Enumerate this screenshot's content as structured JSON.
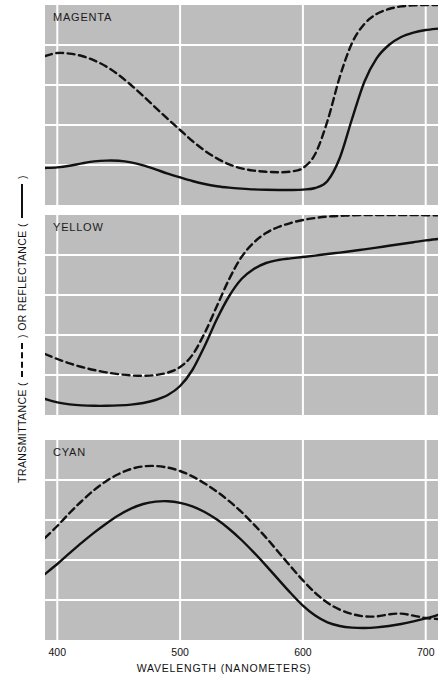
{
  "chart_data": {
    "type": "line",
    "title": "",
    "xlabel": "WAVELENGTH (NANOMETERS)",
    "ylabel": "TRANSMITTANCE (-----) OR REFLECTANCE (——)",
    "ylabel_parts": {
      "prefix": "TRANSMITTANCE (",
      "middle": ") OR REFLECTANCE (",
      "suffix": ")"
    },
    "xlim": [
      390,
      710
    ],
    "ylim": [
      0,
      1.0
    ],
    "xticks": [
      400,
      500,
      600,
      700
    ],
    "xtick_labels": [
      "400",
      "500",
      "600",
      "700"
    ],
    "yticks": [
      0,
      0.2,
      0.4,
      0.6,
      0.8,
      1.0
    ],
    "ytick_labels": [
      "0",
      ".2",
      ".4",
      ".6",
      ".8",
      "1.0"
    ],
    "grid": true,
    "grid_color": "#ffffff",
    "plot_background": "#bdbdbd",
    "legend": [
      {
        "name": "Transmittance",
        "style": "dashed",
        "color": "#111111"
      },
      {
        "name": "Reflectance",
        "style": "solid",
        "color": "#111111"
      }
    ],
    "x": [
      390,
      400,
      410,
      420,
      430,
      440,
      450,
      460,
      470,
      480,
      490,
      500,
      510,
      520,
      530,
      540,
      550,
      560,
      570,
      580,
      590,
      600,
      610,
      620,
      630,
      640,
      650,
      660,
      670,
      680,
      690,
      700,
      710
    ],
    "panels": [
      {
        "label": "MAGENTA",
        "series": [
          {
            "name": "Transmittance",
            "style": "dashed",
            "values": [
              0.745,
              0.76,
              0.757,
              0.745,
              0.723,
              0.692,
              0.65,
              0.6,
              0.545,
              0.487,
              0.43,
              0.375,
              0.32,
              0.272,
              0.233,
              0.203,
              0.183,
              0.172,
              0.166,
              0.164,
              0.167,
              0.185,
              0.255,
              0.42,
              0.64,
              0.81,
              0.905,
              0.955,
              0.98,
              0.993,
              0.998,
              1.0,
              1.0
            ]
          },
          {
            "name": "Reflectance",
            "style": "solid",
            "values": [
              0.185,
              0.188,
              0.196,
              0.208,
              0.218,
              0.222,
              0.221,
              0.213,
              0.198,
              0.178,
              0.157,
              0.138,
              0.12,
              0.105,
              0.094,
              0.087,
              0.082,
              0.078,
              0.076,
              0.075,
              0.075,
              0.077,
              0.085,
              0.12,
              0.235,
              0.43,
              0.615,
              0.733,
              0.8,
              0.84,
              0.862,
              0.875,
              0.882
            ]
          }
        ]
      },
      {
        "label": "YELLOW",
        "series": [
          {
            "name": "Transmittance",
            "style": "dashed",
            "values": [
              0.305,
              0.28,
              0.258,
              0.24,
              0.225,
              0.213,
              0.204,
              0.198,
              0.196,
              0.2,
              0.212,
              0.24,
              0.3,
              0.41,
              0.545,
              0.68,
              0.79,
              0.862,
              0.91,
              0.94,
              0.96,
              0.975,
              0.985,
              0.992,
              0.996,
              0.998,
              1.0,
              1.0,
              1.0,
              1.0,
              1.0,
              0.999,
              0.998
            ]
          },
          {
            "name": "Reflectance",
            "style": "solid",
            "values": [
              0.08,
              0.063,
              0.053,
              0.048,
              0.046,
              0.046,
              0.048,
              0.052,
              0.06,
              0.075,
              0.1,
              0.145,
              0.225,
              0.345,
              0.48,
              0.595,
              0.68,
              0.73,
              0.76,
              0.775,
              0.783,
              0.79,
              0.797,
              0.805,
              0.812,
              0.82,
              0.828,
              0.837,
              0.846,
              0.855,
              0.864,
              0.873,
              0.88
            ]
          }
        ]
      },
      {
        "label": "CYAN",
        "series": [
          {
            "name": "Transmittance",
            "style": "dashed",
            "values": [
              0.51,
              0.57,
              0.635,
              0.695,
              0.75,
              0.795,
              0.83,
              0.855,
              0.868,
              0.87,
              0.862,
              0.845,
              0.818,
              0.783,
              0.742,
              0.694,
              0.64,
              0.578,
              0.512,
              0.44,
              0.368,
              0.298,
              0.236,
              0.186,
              0.152,
              0.13,
              0.118,
              0.118,
              0.128,
              0.132,
              0.122,
              0.11,
              0.105
            ]
          },
          {
            "name": "Reflectance",
            "style": "solid",
            "values": [
              0.33,
              0.38,
              0.434,
              0.487,
              0.537,
              0.583,
              0.624,
              0.657,
              0.68,
              0.692,
              0.694,
              0.686,
              0.668,
              0.64,
              0.602,
              0.555,
              0.5,
              0.438,
              0.372,
              0.303,
              0.235,
              0.172,
              0.122,
              0.088,
              0.07,
              0.062,
              0.06,
              0.063,
              0.07,
              0.08,
              0.093,
              0.108,
              0.125
            ]
          }
        ]
      }
    ]
  }
}
